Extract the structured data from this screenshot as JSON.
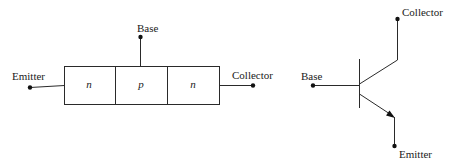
{
  "left_diagram": {
    "title": "npn junction block",
    "terminals": {
      "emitter": "Emitter",
      "base": "Base",
      "collector": "Collector"
    },
    "regions": [
      "n",
      "p",
      "n"
    ]
  },
  "right_diagram": {
    "title": "npn transistor symbol",
    "terminals": {
      "base": "Base",
      "collector": "Collector",
      "emitter": "Emitter"
    }
  }
}
